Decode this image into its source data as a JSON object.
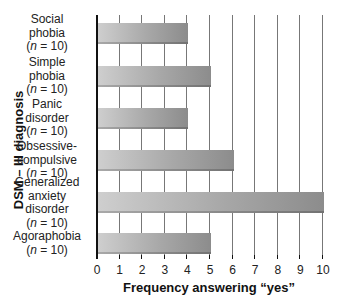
{
  "chart_data": {
    "type": "bar",
    "orientation": "horizontal",
    "title": "",
    "xlabel": "Frequency answering “yes”",
    "ylabel": "DSM – III diagnosis",
    "xlim": [
      0,
      10
    ],
    "xticks": [
      "0",
      "1",
      "2",
      "3",
      "4",
      "5",
      "6",
      "7",
      "8",
      "9",
      "10"
    ],
    "grid": "vertical",
    "legend": null,
    "categories": [
      {
        "lines": [
          "Social",
          "phobia"
        ],
        "n": "(n = 10)"
      },
      {
        "lines": [
          "Simple",
          "phobia"
        ],
        "n": "(n = 10)"
      },
      {
        "lines": [
          "Panic",
          "disorder"
        ],
        "n": "(n = 10)"
      },
      {
        "lines": [
          "Obsessive-",
          "compulsive"
        ],
        "n": "(n = 10)"
      },
      {
        "lines": [
          "Generalized",
          "anxiety",
          "disorder"
        ],
        "n": "(n = 10)"
      },
      {
        "lines": [
          "Agoraphobia"
        ],
        "n": "(n = 10)"
      }
    ],
    "category_names": [
      "Social phobia",
      "Simple phobia",
      "Panic disorder",
      "Obsessive-compulsive",
      "Generalized anxiety disorder",
      "Agoraphobia"
    ],
    "n_values": [
      10,
      10,
      10,
      10,
      10,
      10
    ],
    "values": [
      4,
      5,
      4,
      6,
      10,
      5
    ],
    "bar_color": "#a8a8a8"
  }
}
